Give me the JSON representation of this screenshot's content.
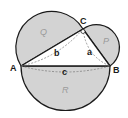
{
  "diagram": {
    "vertices": {
      "A": {
        "label": "A",
        "x": 21,
        "y": 66
      },
      "B": {
        "label": "B",
        "x": 110,
        "y": 66
      },
      "C": {
        "label": "C",
        "x": 83,
        "y": 29
      }
    },
    "sides": {
      "a": {
        "label": "a"
      },
      "b": {
        "label": "b"
      },
      "c": {
        "label": "c"
      }
    },
    "regions": {
      "Q": {
        "label": "Q"
      },
      "P": {
        "label": "P"
      },
      "R": {
        "label": "R"
      }
    },
    "colors": {
      "fill": "#d3d3d3",
      "stroke": "#1a1a1a",
      "dashed": "#777777",
      "region_label": "#9a9a9a"
    }
  }
}
